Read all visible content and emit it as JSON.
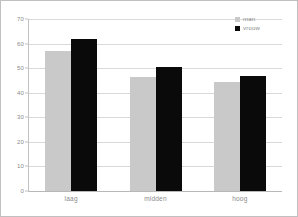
{
  "chart_data": {
    "type": "bar",
    "title": "",
    "subtitle": "",
    "xlabel": "",
    "ylabel": "",
    "categories": [
      "laag",
      "midden",
      "hoog"
    ],
    "series": [
      {
        "name": "man",
        "color": "#c9c9c9",
        "values": [
          57,
          46.5,
          44.5
        ]
      },
      {
        "name": "vrouw",
        "color": "#0a0a0a",
        "values": [
          62,
          50.5,
          47
        ]
      }
    ],
    "ylim": [
      0,
      70
    ],
    "ytick_step": 10,
    "yticks": [
      0,
      10,
      20,
      30,
      40,
      50,
      60,
      70
    ],
    "ytick_labels": [
      "0",
      "10",
      "20",
      "30",
      "40",
      "50",
      "60",
      "70"
    ],
    "grid": true,
    "grid_axis": "y",
    "legend_position": "top-right",
    "annotations": []
  },
  "legend": {
    "items": [
      {
        "label": "man",
        "swatch": "legend-swatch-man"
      },
      {
        "label": "vrouw",
        "swatch": "legend-swatch-vrouw"
      }
    ]
  },
  "colors": {
    "series_man": "#c9c9c9",
    "series_vrouw": "#0a0a0a",
    "gridline": "#d9d9d9",
    "axis": "#c2c2c2",
    "text": "#8a8a8a",
    "background": "#ffffff",
    "border": "#c0c0c0"
  }
}
